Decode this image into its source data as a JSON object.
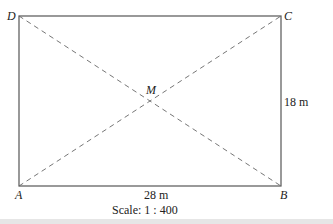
{
  "diagram": {
    "type": "rectangle-with-diagonals",
    "vertices": {
      "A": "A",
      "B": "B",
      "C": "C",
      "D": "D"
    },
    "center": "M",
    "width_label": "28 m",
    "height_label": "18 m",
    "scale_label": "Scale: 1 : 400",
    "colors": {
      "line": "#555555",
      "text": "#222222"
    }
  }
}
